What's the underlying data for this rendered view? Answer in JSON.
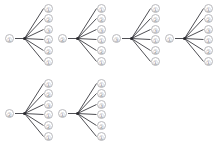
{
  "canvas": {
    "width": 218,
    "height": 153,
    "background": "#ffffff"
  },
  "figure": {
    "type": "fan-tree-grid",
    "rows": 2,
    "columns": 4,
    "edge_color": "#3a3a40",
    "node_stroke": "#b9b9bd",
    "node_text_color": "#8d8d93",
    "hub_color": "#2b2b30"
  },
  "leaf_offsets_y": [
    1,
    11,
    22,
    32,
    43,
    54
  ],
  "trees": [
    {
      "id": "tree-1",
      "position": {
        "x": 4,
        "y": 3
      },
      "root": {
        "label": "①",
        "value": 1
      },
      "leaves": [
        {
          "label": "①",
          "value": 1
        },
        {
          "label": "②",
          "value": 2
        },
        {
          "label": "③",
          "value": 3
        },
        {
          "label": "①",
          "value": 1
        },
        {
          "label": "②",
          "value": 2
        },
        {
          "label": "①",
          "value": 1
        }
      ]
    },
    {
      "id": "tree-2",
      "position": {
        "x": 57,
        "y": 3
      },
      "root": {
        "label": "②",
        "value": 2
      },
      "leaves": [
        {
          "label": "①",
          "value": 1
        },
        {
          "label": "②",
          "value": 2
        },
        {
          "label": "③",
          "value": 3
        },
        {
          "label": "①",
          "value": 1
        },
        {
          "label": "②",
          "value": 2
        },
        {
          "label": "①",
          "value": 1
        }
      ]
    },
    {
      "id": "tree-3",
      "position": {
        "x": 111,
        "y": 3
      },
      "root": {
        "label": "③",
        "value": 3
      },
      "leaves": [
        {
          "label": "①",
          "value": 1
        },
        {
          "label": "②",
          "value": 2
        },
        {
          "label": "③",
          "value": 3
        },
        {
          "label": "①",
          "value": 1
        },
        {
          "label": "②",
          "value": 2
        },
        {
          "label": "①",
          "value": 1
        }
      ]
    },
    {
      "id": "tree-4",
      "position": {
        "x": 164,
        "y": 3
      },
      "root": {
        "label": "①",
        "value": 1
      },
      "leaves": [
        {
          "label": "①",
          "value": 1
        },
        {
          "label": "②",
          "value": 2
        },
        {
          "label": "③",
          "value": 3
        },
        {
          "label": "①",
          "value": 1
        },
        {
          "label": "②",
          "value": 2
        },
        {
          "label": "①",
          "value": 1
        }
      ]
    },
    {
      "id": "tree-5",
      "position": {
        "x": 4,
        "y": 78
      },
      "root": {
        "label": "②",
        "value": 2
      },
      "leaves": [
        {
          "label": "①",
          "value": 1
        },
        {
          "label": "②",
          "value": 2
        },
        {
          "label": "③",
          "value": 3
        },
        {
          "label": "①",
          "value": 1
        },
        {
          "label": "②",
          "value": 2
        },
        {
          "label": "①",
          "value": 1
        }
      ]
    },
    {
      "id": "tree-6",
      "position": {
        "x": 57,
        "y": 78
      },
      "root": {
        "label": "①",
        "value": 1
      },
      "leaves": [
        {
          "label": "①",
          "value": 1
        },
        {
          "label": "②",
          "value": 2
        },
        {
          "label": "③",
          "value": 3
        },
        {
          "label": "①",
          "value": 1
        },
        {
          "label": "②",
          "value": 2
        },
        {
          "label": "①",
          "value": 1
        }
      ]
    }
  ]
}
